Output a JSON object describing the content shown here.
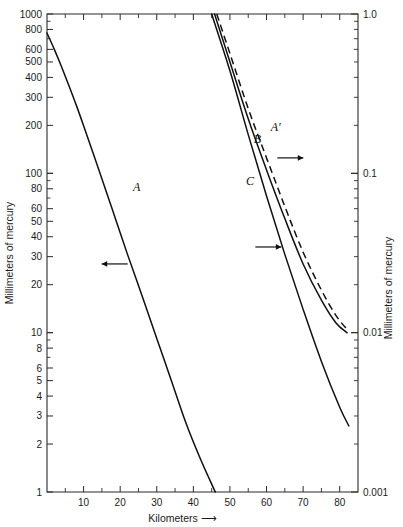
{
  "chart_data": {
    "type": "line",
    "title": "",
    "xlabel": "Kilometers",
    "xlabel_suffix": "⟶",
    "ylabel_left": "Millimeters of mercury",
    "ylabel_right": "Millimeters of mercury",
    "grid": false,
    "legend": "inline-curve-labels",
    "x_axis": {
      "scale": "linear",
      "min": 0,
      "max": 85,
      "major_ticks": [
        10,
        20,
        30,
        40,
        50,
        60,
        70,
        80
      ],
      "major_tick_labels": [
        "10",
        "20",
        "30",
        "40",
        "50",
        "60",
        "70",
        "80"
      ],
      "minor_tick_step": 5
    },
    "y_axis_left": {
      "scale": "log",
      "min": 1,
      "max": 1000,
      "decades": 3,
      "labeled_ticks": [
        1000,
        800,
        600,
        500,
        400,
        300,
        200,
        100,
        80,
        60,
        50,
        40,
        30,
        20,
        10,
        8,
        6,
        5,
        4,
        3,
        2,
        1
      ],
      "labeled_tick_text": [
        "1000",
        "800",
        "600",
        "500",
        "400",
        "300",
        "200",
        "100",
        "80",
        "60",
        "50",
        "40",
        "30",
        "20",
        "10",
        "8",
        "6",
        "5",
        "4",
        "3",
        "2",
        "1"
      ],
      "unlabeled_minor_ticks": [
        900,
        700,
        90,
        70,
        9,
        7
      ]
    },
    "y_axis_right": {
      "scale": "log",
      "min": 0.001,
      "max": 1.0,
      "decades": 3,
      "labeled_ticks": [
        1.0,
        0.1,
        0.01,
        0.001
      ],
      "labeled_tick_text": [
        "1.0",
        "0.1",
        "0.01",
        "0.001"
      ]
    },
    "series": [
      {
        "name": "A",
        "label": "A",
        "style": "solid",
        "axis": "left",
        "points_km_mmhg": [
          [
            0,
            760
          ],
          [
            2,
            600
          ],
          [
            4,
            465
          ],
          [
            6,
            355
          ],
          [
            8,
            268
          ],
          [
            10,
            199
          ],
          [
            14,
            108
          ],
          [
            18,
            58
          ],
          [
            22,
            31
          ],
          [
            26,
            17
          ],
          [
            30,
            9.2
          ],
          [
            34,
            5.0
          ],
          [
            38,
            2.7
          ],
          [
            42,
            1.6
          ],
          [
            46,
            1.0
          ]
        ],
        "label_position_km_mmhg": [
          24.5,
          78
        ],
        "arrow_direction": "left",
        "arrow_position_km_mmhg": [
          18.5,
          27
        ]
      },
      {
        "name": "B",
        "label": "B",
        "style": "solid",
        "axis": "right",
        "points_km_mmhg": [
          [
            45.8,
            1.0
          ],
          [
            50,
            0.5
          ],
          [
            55,
            0.22
          ],
          [
            60,
            0.105
          ],
          [
            65,
            0.052
          ],
          [
            70,
            0.027
          ],
          [
            75,
            0.016
          ],
          [
            79,
            0.0115
          ],
          [
            82,
            0.01
          ]
        ],
        "label_position_km_mmhg": [
          57.5,
          0.155
        ],
        "arrow_direction": "right",
        "arrow_position_km_mmhg": [
          66.5,
          0.125
        ]
      },
      {
        "name": "C",
        "label": "C",
        "style": "solid",
        "axis": "right",
        "points_km_mmhg": [
          [
            45.0,
            1.0
          ],
          [
            50,
            0.44
          ],
          [
            55,
            0.175
          ],
          [
            60,
            0.072
          ],
          [
            65,
            0.031
          ],
          [
            70,
            0.014
          ],
          [
            75,
            0.0066
          ],
          [
            80,
            0.0034
          ],
          [
            82.5,
            0.0026
          ]
        ],
        "label_position_km_mmhg": [
          55.5,
          0.085
        ],
        "arrow_direction": "right",
        "arrow_position_km_mmhg": [
          60.5,
          0.0345
        ]
      },
      {
        "name": "A'",
        "label": "A′",
        "style": "dashed",
        "axis": "right",
        "points_km_mmhg": [
          [
            46.4,
            1.0
          ],
          [
            50,
            0.565
          ],
          [
            55,
            0.255
          ],
          [
            60,
            0.125
          ],
          [
            65,
            0.062
          ],
          [
            70,
            0.032
          ],
          [
            75,
            0.0185
          ],
          [
            79,
            0.0128
          ],
          [
            82,
            0.0105
          ]
        ],
        "label_position_km_mmhg": [
          62.5,
          0.185
        ],
        "arrow_direction": "none"
      }
    ]
  },
  "figure": {
    "plot_box": {
      "left": 47,
      "top": 14,
      "right": 358,
      "bottom": 492
    },
    "colors": {
      "axis": "#2a2a2a",
      "curve": "#101010",
      "background": "#ffffff",
      "text": "#1b1b1b"
    }
  }
}
